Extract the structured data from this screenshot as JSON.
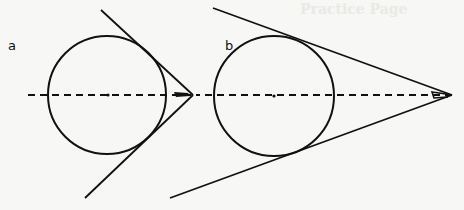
{
  "panels": [
    {
      "label": "a"
    },
    {
      "label": "b"
    }
  ],
  "background_ghost_text": "Practice Page",
  "colors": {
    "ink": "#111111",
    "paper": "#f7f7f5"
  }
}
